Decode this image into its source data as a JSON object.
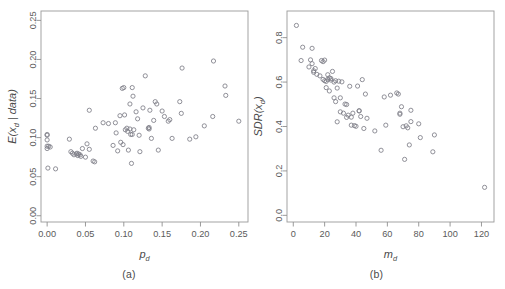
{
  "figure": {
    "background": "#ffffff",
    "point_color": "#7d7d86",
    "axis_color": "#9a9a9a",
    "text_color": "#5a5a5a"
  },
  "panel_a": {
    "caption": "(a)",
    "xlabel_main": "p",
    "xlabel_sub": "d",
    "ylabel_parts": [
      "E(x",
      "d",
      " | data)"
    ],
    "ylabel_plain": "E(x_d | data)",
    "xticks": [
      "0.00",
      "0.05",
      "0.10",
      "0.15",
      "0.20",
      "0.25"
    ],
    "yticks": [
      "0.00",
      "0.05",
      "0.10",
      "0.15",
      "0.20",
      "0.25"
    ]
  },
  "panel_b": {
    "caption": "(b)",
    "xlabel_main": "m",
    "xlabel_sub": "d",
    "ylabel_parts": [
      "SDR(x",
      "d",
      ")"
    ],
    "ylabel_plain": "SDR(x_d)",
    "xticks": [
      "0",
      "20",
      "40",
      "60",
      "80",
      "100",
      "120"
    ],
    "yticks": [
      "0.0",
      "0.2",
      "0.4",
      "0.6",
      "0.8"
    ]
  },
  "chart_data": [
    {
      "type": "scatter",
      "id": "panel-a",
      "title": "",
      "subtitle": "(a)",
      "xlabel": "p_d",
      "ylabel": "E(x_d | data)",
      "xlim": [
        -0.008,
        0.262
      ],
      "ylim": [
        -0.008,
        0.262
      ],
      "xticks": [
        0.0,
        0.05,
        0.1,
        0.15,
        0.2,
        0.25
      ],
      "yticks": [
        0.0,
        0.05,
        0.1,
        0.15,
        0.2,
        0.25
      ],
      "grid": false,
      "legend": "none",
      "marker": "open-circle",
      "points": [
        [
          0.0,
          0.104
        ],
        [
          0.0,
          0.103
        ],
        [
          0.0,
          0.097
        ],
        [
          0.0,
          0.089
        ],
        [
          0.0,
          0.086
        ],
        [
          0.001,
          0.061
        ],
        [
          0.002,
          0.089
        ],
        [
          0.004,
          0.088
        ],
        [
          0.011,
          0.06
        ],
        [
          0.029,
          0.098
        ],
        [
          0.031,
          0.082
        ],
        [
          0.033,
          0.08
        ],
        [
          0.035,
          0.078
        ],
        [
          0.038,
          0.079
        ],
        [
          0.039,
          0.08
        ],
        [
          0.04,
          0.077
        ],
        [
          0.041,
          0.079
        ],
        [
          0.043,
          0.078
        ],
        [
          0.044,
          0.076
        ],
        [
          0.046,
          0.086
        ],
        [
          0.05,
          0.075
        ],
        [
          0.052,
          0.092
        ],
        [
          0.055,
          0.135
        ],
        [
          0.055,
          0.085
        ],
        [
          0.06,
          0.07
        ],
        [
          0.062,
          0.069
        ],
        [
          0.063,
          0.112
        ],
        [
          0.073,
          0.119
        ],
        [
          0.08,
          0.118
        ],
        [
          0.086,
          0.09
        ],
        [
          0.089,
          0.119
        ],
        [
          0.09,
          0.106
        ],
        [
          0.092,
          0.083
        ],
        [
          0.095,
          0.128
        ],
        [
          0.096,
          0.094
        ],
        [
          0.098,
          0.163
        ],
        [
          0.099,
          0.091
        ],
        [
          0.1,
          0.164
        ],
        [
          0.101,
          0.129
        ],
        [
          0.102,
          0.11
        ],
        [
          0.104,
          0.112
        ],
        [
          0.105,
          0.108
        ],
        [
          0.106,
          0.084
        ],
        [
          0.108,
          0.143
        ],
        [
          0.108,
          0.111
        ],
        [
          0.109,
          0.104
        ],
        [
          0.11,
          0.067
        ],
        [
          0.111,
          0.164
        ],
        [
          0.111,
          0.104
        ],
        [
          0.112,
          0.153
        ],
        [
          0.113,
          0.11
        ],
        [
          0.116,
          0.133
        ],
        [
          0.118,
          0.124
        ],
        [
          0.12,
          0.103
        ],
        [
          0.121,
          0.082
        ],
        [
          0.125,
          0.138
        ],
        [
          0.128,
          0.179
        ],
        [
          0.132,
          0.112
        ],
        [
          0.133,
          0.113
        ],
        [
          0.133,
          0.111
        ],
        [
          0.134,
          0.135
        ],
        [
          0.136,
          0.099
        ],
        [
          0.139,
          0.122
        ],
        [
          0.141,
          0.146
        ],
        [
          0.143,
          0.143
        ],
        [
          0.145,
          0.084
        ],
        [
          0.15,
          0.134
        ],
        [
          0.153,
          0.127
        ],
        [
          0.158,
          0.121
        ],
        [
          0.16,
          0.123
        ],
        [
          0.163,
          0.099
        ],
        [
          0.173,
          0.146
        ],
        [
          0.175,
          0.131
        ],
        [
          0.176,
          0.189
        ],
        [
          0.186,
          0.098
        ],
        [
          0.194,
          0.101
        ],
        [
          0.205,
          0.115
        ],
        [
          0.216,
          0.127
        ],
        [
          0.217,
          0.198
        ],
        [
          0.232,
          0.166
        ],
        [
          0.233,
          0.154
        ],
        [
          0.25,
          0.121
        ]
      ]
    },
    {
      "type": "scatter",
      "id": "panel-b",
      "title": "",
      "subtitle": "(b)",
      "xlabel": "m_d",
      "ylabel": "SDR(x_d)",
      "xlim": [
        -4,
        128
      ],
      "ylim": [
        -0.03,
        0.92
      ],
      "xticks": [
        0,
        20,
        40,
        60,
        80,
        100,
        120
      ],
      "yticks": [
        0.0,
        0.2,
        0.4,
        0.6,
        0.8
      ],
      "grid": false,
      "legend": "none",
      "marker": "open-circle",
      "points": [
        [
          2,
          0.855
        ],
        [
          5,
          0.697
        ],
        [
          6,
          0.757
        ],
        [
          10,
          0.668
        ],
        [
          11,
          0.7
        ],
        [
          12,
          0.683
        ],
        [
          12,
          0.752
        ],
        [
          13,
          0.644
        ],
        [
          13,
          0.651
        ],
        [
          14,
          0.661
        ],
        [
          15,
          0.635
        ],
        [
          17,
          0.628
        ],
        [
          18,
          0.697
        ],
        [
          19,
          0.692
        ],
        [
          19,
          0.612
        ],
        [
          20,
          0.606
        ],
        [
          20,
          0.699
        ],
        [
          21,
          0.603
        ],
        [
          21,
          0.575
        ],
        [
          22,
          0.633
        ],
        [
          22,
          0.612
        ],
        [
          23,
          0.619
        ],
        [
          23,
          0.56
        ],
        [
          24,
          0.616
        ],
        [
          24,
          0.609
        ],
        [
          25,
          0.648
        ],
        [
          26,
          0.6
        ],
        [
          26,
          0.529
        ],
        [
          27,
          0.606
        ],
        [
          27,
          0.512
        ],
        [
          28,
          0.573
        ],
        [
          28,
          0.421
        ],
        [
          29,
          0.604
        ],
        [
          30,
          0.529
        ],
        [
          30,
          0.466
        ],
        [
          31,
          0.601
        ],
        [
          32,
          0.46
        ],
        [
          33,
          0.501
        ],
        [
          34,
          0.499
        ],
        [
          34,
          0.441
        ],
        [
          35,
          0.451
        ],
        [
          36,
          0.581
        ],
        [
          37,
          0.442
        ],
        [
          37,
          0.406
        ],
        [
          38,
          0.46
        ],
        [
          39,
          0.404
        ],
        [
          40,
          0.401
        ],
        [
          41,
          0.582
        ],
        [
          42,
          0.471
        ],
        [
          42,
          0.47
        ],
        [
          43,
          0.445
        ],
        [
          44,
          0.611
        ],
        [
          45,
          0.391
        ],
        [
          46,
          0.546
        ],
        [
          47,
          0.437
        ],
        [
          52,
          0.38
        ],
        [
          56,
          0.293
        ],
        [
          58,
          0.533
        ],
        [
          59,
          0.406
        ],
        [
          62,
          0.541
        ],
        [
          66,
          0.551
        ],
        [
          67,
          0.546
        ],
        [
          68,
          0.46
        ],
        [
          68,
          0.455
        ],
        [
          69,
          0.489
        ],
        [
          70,
          0.399
        ],
        [
          71,
          0.252
        ],
        [
          72,
          0.403
        ],
        [
          73,
          0.394
        ],
        [
          74,
          0.317
        ],
        [
          75,
          0.473
        ],
        [
          75,
          0.422
        ],
        [
          80,
          0.412
        ],
        [
          81,
          0.35
        ],
        [
          89,
          0.286
        ],
        [
          90,
          0.362
        ],
        [
          122,
          0.126
        ]
      ]
    }
  ]
}
